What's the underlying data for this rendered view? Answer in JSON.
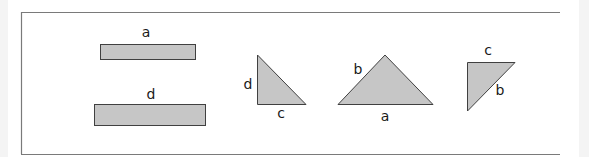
{
  "diagram": {
    "colors": {
      "fill": "#c6c6c6",
      "stroke": "#404040",
      "frame": "#7a7a7a"
    },
    "shapes": [
      {
        "type": "rectangle",
        "label": "a"
      },
      {
        "type": "rectangle",
        "label": "d"
      },
      {
        "type": "right-triangle",
        "labels": [
          "d",
          "c"
        ]
      },
      {
        "type": "triangle",
        "labels": [
          "b",
          "a"
        ]
      },
      {
        "type": "right-triangle",
        "labels": [
          "c",
          "b"
        ]
      }
    ]
  }
}
